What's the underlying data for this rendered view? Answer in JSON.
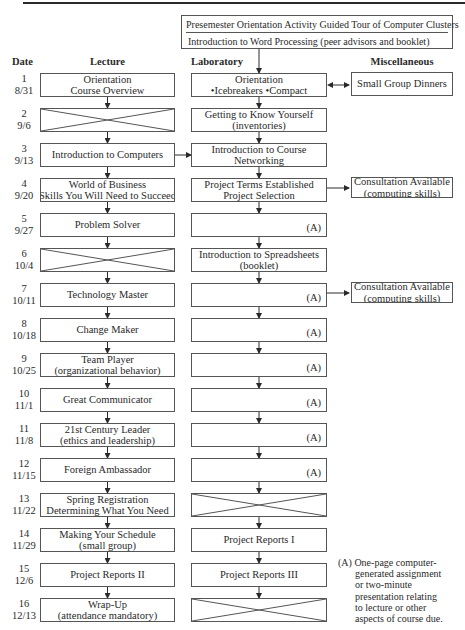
{
  "top_box": {
    "line1": "Presemester Orientation Activity Guided Tour of Computer Clusters",
    "line2": "Introduction to Word Processing (peer advisors and booklet)"
  },
  "headers": {
    "date": "Date",
    "lecture": "Lecture",
    "laboratory": "Laboratory",
    "miscellaneous": "Miscellaneous"
  },
  "marker": "(A)",
  "weeks": [
    {
      "num": "1",
      "date": "8/31",
      "lecture": [
        "Orientation",
        "Course Overview"
      ],
      "lab": [
        "Orientation",
        "•Icebreakers  •Compact"
      ],
      "misc": [
        "Small Group Dinners"
      ]
    },
    {
      "num": "2",
      "date": "9/6",
      "lecture": null,
      "lab": [
        "Getting to Know Yourself",
        "(inventories)"
      ]
    },
    {
      "num": "3",
      "date": "9/13",
      "lecture": [
        "Introduction to Computers"
      ],
      "lab": [
        "Introduction to Course",
        "Networking"
      ]
    },
    {
      "num": "4",
      "date": "9/20",
      "lecture": [
        "World of Business",
        "Skills You Will Need to Succeed"
      ],
      "lab": [
        "Project Terms Established",
        "Project Selection"
      ],
      "misc": [
        "Consultation Available",
        "(computing skills)"
      ]
    },
    {
      "num": "5",
      "date": "9/27",
      "lecture": [
        "Problem Solver"
      ],
      "lab": "A"
    },
    {
      "num": "6",
      "date": "10/4",
      "lecture": null,
      "lab": [
        "Introduction to Spreadsheets",
        "(booklet)"
      ]
    },
    {
      "num": "7",
      "date": "10/11",
      "lecture": [
        "Technology Master"
      ],
      "lab": "A",
      "misc": [
        "Consultation Available",
        "(computing skills)"
      ]
    },
    {
      "num": "8",
      "date": "10/18",
      "lecture": [
        "Change Maker"
      ],
      "lab": "A"
    },
    {
      "num": "9",
      "date": "10/25",
      "lecture": [
        "Team Player",
        "(organizational behavior)"
      ],
      "lab": "A"
    },
    {
      "num": "10",
      "date": "11/1",
      "lecture": [
        "Great Communicator"
      ],
      "lab": "A"
    },
    {
      "num": "11",
      "date": "11/8",
      "lecture": [
        "21st Century Leader",
        "(ethics and leadership)"
      ],
      "lab": "A"
    },
    {
      "num": "12",
      "date": "11/15",
      "lecture": [
        "Foreign Ambassador"
      ],
      "lab": "A"
    },
    {
      "num": "13",
      "date": "11/22",
      "lecture": [
        "Spring Registration",
        "Determining What You Need"
      ],
      "lab": null
    },
    {
      "num": "14",
      "date": "11/29",
      "lecture": [
        "Making Your Schedule",
        "(small group)"
      ],
      "lab": [
        "Project Reports I"
      ]
    },
    {
      "num": "15",
      "date": "12/6",
      "lecture": [
        "Project Reports II"
      ],
      "lab": [
        "Project Reports III"
      ]
    },
    {
      "num": "16",
      "date": "12/13",
      "lecture": [
        "Wrap-Up",
        "(attendance mandatory)"
      ],
      "lab": null
    }
  ],
  "footnote": {
    "label": "(A)",
    "lines": [
      "One-page computer-",
      "generated assignment",
      "or two-minute",
      "presentation relating",
      "to lecture or other",
      "aspects of course due."
    ]
  }
}
